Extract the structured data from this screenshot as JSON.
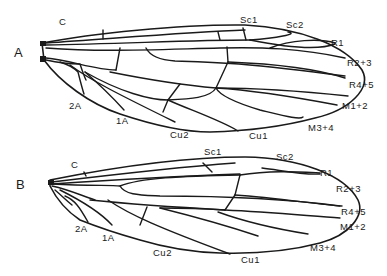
{
  "figure": {
    "panels": [
      {
        "id": "A",
        "label": "A",
        "vein_labels": {
          "C": "C",
          "Sc1": "Sc1",
          "Sc2": "Sc2",
          "R1": "R1",
          "R2_3": "R2+3",
          "R4_5": "R4+5",
          "M1_2": "M1+2",
          "M3_4": "M3+4",
          "Cu1": "Cu1",
          "Cu2": "Cu2",
          "A1": "1A",
          "A2": "2A"
        }
      },
      {
        "id": "B",
        "label": "B",
        "vein_labels": {
          "C": "C",
          "Sc1": "Sc1",
          "Sc2": "Sc2",
          "R1": "R1",
          "R2_3": "R2+3",
          "R4_5": "R4+5",
          "M1_2": "M1+2",
          "M3_4": "M3+4",
          "Cu1": "Cu1",
          "Cu2": "Cu2",
          "A1": "1A",
          "A2": "2A"
        }
      }
    ],
    "colors": {
      "ink": "#1a1a1a",
      "background": "#ffffff"
    }
  }
}
